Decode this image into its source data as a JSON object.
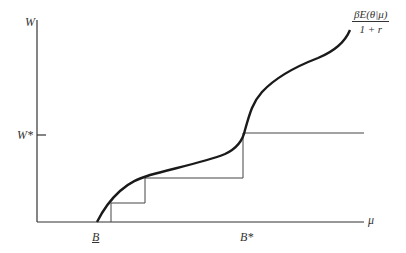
{
  "diagram": {
    "y_axis_label": "W",
    "x_axis_label": "μ",
    "y_tick_label": "W*",
    "x_tick_labels": [
      "B",
      "B*"
    ],
    "x_tick_label_underlined": "B",
    "curve_label": {
      "numerator": "βE(θ|μ)",
      "denominator": "1 + r"
    },
    "colors": {
      "curve": "#1a1a1a",
      "axes": "#333333",
      "staircase": "#444444"
    }
  }
}
